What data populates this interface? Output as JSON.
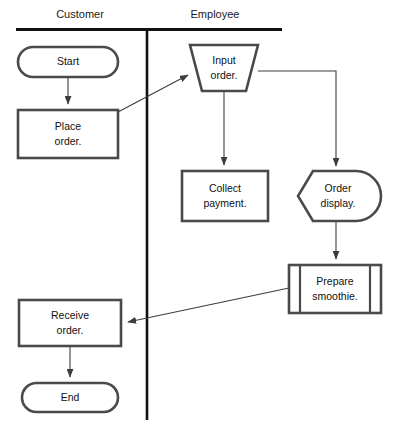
{
  "diagram": {
    "type": "cross-functional-flowchart",
    "colors": {
      "background": "#ffffff",
      "shape_stroke": "#4a4a4a",
      "divider": "#111111",
      "connector": "#3d3d3d",
      "text": "#111111"
    },
    "lanes": [
      {
        "id": "customer",
        "label": "Customer",
        "label_x": 80,
        "label_y": 15
      },
      {
        "id": "employee",
        "label": "Employee",
        "label_x": 215,
        "label_y": 15
      }
    ],
    "dividers": {
      "top_rule": {
        "x1": 16,
        "y1": 29,
        "x2": 282,
        "y2": 29
      },
      "vertical_rule": {
        "x1": 147,
        "y1": 29,
        "x2": 147,
        "y2": 420
      }
    },
    "nodes": [
      {
        "id": "start",
        "label": "Start",
        "shape": "terminator",
        "lane": "customer",
        "x": 18,
        "y": 47,
        "w": 100,
        "h": 30,
        "lines": [
          "Start"
        ]
      },
      {
        "id": "place-order",
        "label": "Place order.",
        "shape": "process",
        "lane": "customer",
        "x": 18,
        "y": 110,
        "w": 100,
        "h": 48,
        "lines": [
          "Place",
          "order."
        ]
      },
      {
        "id": "input-order",
        "label": "Input order.",
        "shape": "manual-operation-trapezoid",
        "lane": "employee",
        "x": 190,
        "y": 45,
        "w": 68,
        "h": 46,
        "lines": [
          "Input",
          "order."
        ]
      },
      {
        "id": "collect-payment",
        "label": "Collect payment.",
        "shape": "process",
        "lane": "employee",
        "x": 182,
        "y": 171,
        "w": 86,
        "h": 50,
        "lines": [
          "Collect",
          "payment."
        ]
      },
      {
        "id": "order-display",
        "label": "Order display.",
        "shape": "display",
        "lane": "employee",
        "x": 298,
        "y": 171,
        "w": 76,
        "h": 50,
        "lines": [
          "Order",
          "display."
        ]
      },
      {
        "id": "prepare-smoothie",
        "label": "Prepare smoothie.",
        "shape": "predefined-process",
        "lane": "employee",
        "x": 289,
        "y": 265,
        "w": 92,
        "h": 48,
        "lines": [
          "Prepare",
          "smoothie."
        ]
      },
      {
        "id": "receive-order",
        "label": "Receive order.",
        "shape": "process",
        "lane": "customer",
        "x": 19,
        "y": 300,
        "w": 102,
        "h": 46,
        "lines": [
          "Receive",
          "order."
        ]
      },
      {
        "id": "end",
        "label": "End",
        "shape": "terminator",
        "lane": "customer",
        "x": 22,
        "y": 383,
        "w": 96,
        "h": 29,
        "lines": [
          "End"
        ]
      }
    ],
    "connectors": [
      {
        "id": "start-to-place-order",
        "from": "start",
        "to": "place-order",
        "path": "M 68 77 L 68 107",
        "arrow": true
      },
      {
        "id": "place-order-to-input-order",
        "from": "place-order",
        "to": "input-order",
        "path": "M 118 112 L 191 73",
        "arrow": true
      },
      {
        "id": "input-order-to-collect-payment",
        "from": "input-order",
        "to": "collect-payment",
        "path": "M 224 91 L 224 168",
        "arrow": true
      },
      {
        "id": "input-order-to-order-display",
        "from": "input-order",
        "to": "order-display",
        "path": "M 258 71 L 336 71 L 336 168",
        "arrow": true
      },
      {
        "id": "order-display-to-prepare-smoothie",
        "from": "order-display",
        "to": "prepare-smoothie",
        "path": "M 336 221 L 336 262",
        "arrow": true
      },
      {
        "id": "prepare-smoothie-to-receive-order",
        "from": "prepare-smoothie",
        "to": "receive-order",
        "path": "M 289 288 L 124 323",
        "arrow": true
      },
      {
        "id": "receive-order-to-end",
        "from": "receive-order",
        "to": "end",
        "path": "M 70 346 L 70 380",
        "arrow": true
      }
    ]
  }
}
